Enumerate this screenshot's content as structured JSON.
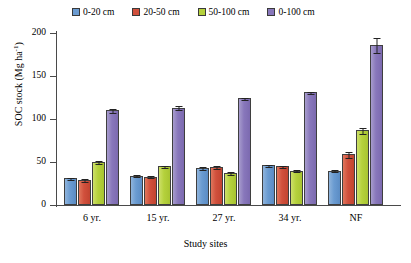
{
  "chart_data": {
    "type": "bar",
    "title": "",
    "xlabel": "Study sites",
    "ylabel": "SOC stock (Mg ha⁻¹)",
    "ylabel_main": "SOC stock (Mg ha",
    "ylabel_sup": "-1",
    "ylabel_tail": ")",
    "categories": [
      "6 yr.",
      "15 yr.",
      "27 yr.",
      "34 yr.",
      "NF"
    ],
    "ylim": [
      0,
      200
    ],
    "yticks": [
      0,
      50,
      100,
      150,
      200
    ],
    "ytick_labels": [
      "0",
      "50",
      "100",
      "150",
      "200"
    ],
    "grid": false,
    "legend_position": "top",
    "series": [
      {
        "name": "0-20 cm",
        "color": "#6a9bd1",
        "values": [
          31,
          34,
          43,
          46,
          40
        ],
        "errors": [
          2,
          2,
          2,
          2,
          2
        ]
      },
      {
        "name": "20-50 cm",
        "color": "#d1503c",
        "values": [
          29,
          33,
          44,
          45,
          59
        ],
        "errors": [
          2,
          2,
          2,
          2,
          4
        ]
      },
      {
        "name": "50-100 cm",
        "color": "#b5d13c",
        "values": [
          50,
          45,
          37,
          40,
          87
        ],
        "errors": [
          2,
          2,
          2,
          2,
          4
        ]
      },
      {
        "name": "0-100 cm",
        "color": "#8877bb",
        "values": [
          110,
          113,
          124,
          131,
          186
        ],
        "errors": [
          3,
          3,
          2,
          2,
          9
        ]
      }
    ]
  },
  "legend": {
    "items": [
      {
        "label": "0-20 cm"
      },
      {
        "label": "20-50 cm"
      },
      {
        "label": "50-100 cm"
      },
      {
        "label": "0-100 cm"
      }
    ]
  },
  "axes": {
    "y_title": "SOC stock (Mg ha-1)",
    "x_title": "Study sites"
  }
}
